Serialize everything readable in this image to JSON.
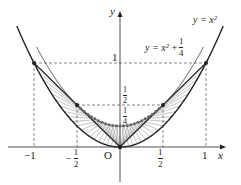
{
  "diagram": {
    "axes": {
      "x_label": "x",
      "y_label": "y",
      "origin_label": "O"
    },
    "curves": [
      {
        "name": "parabola",
        "label": "y = x²",
        "equation": "y=x^2"
      },
      {
        "name": "shifted-parabola",
        "label_prefix": "y = x² + ",
        "frac_num": "1",
        "frac_den": "4",
        "equation": "y=x^2+1/4"
      }
    ],
    "x_ticks": [
      {
        "value": -1,
        "label": "−1"
      },
      {
        "value": -0.5,
        "label_sign": "−",
        "num": "1",
        "den": "2"
      },
      {
        "value": 0.5,
        "num": "1",
        "den": "2"
      },
      {
        "value": 1,
        "label": "1"
      }
    ],
    "y_ticks": [
      {
        "value": 1,
        "label": "1"
      },
      {
        "value": 0.5,
        "num": "1",
        "den": "2"
      },
      {
        "value": 0.25,
        "num": "1",
        "den": "4"
      }
    ],
    "points": [
      {
        "x": -1,
        "y": 1
      },
      {
        "x": 1,
        "y": 1
      },
      {
        "x": 0,
        "y": 0
      },
      {
        "x": -0.5,
        "y": 0.5
      },
      {
        "x": 0.5,
        "y": 0.5
      }
    ],
    "colors": {
      "ink": "#222222",
      "hatch": "#777777",
      "dashes": "#555555"
    }
  }
}
